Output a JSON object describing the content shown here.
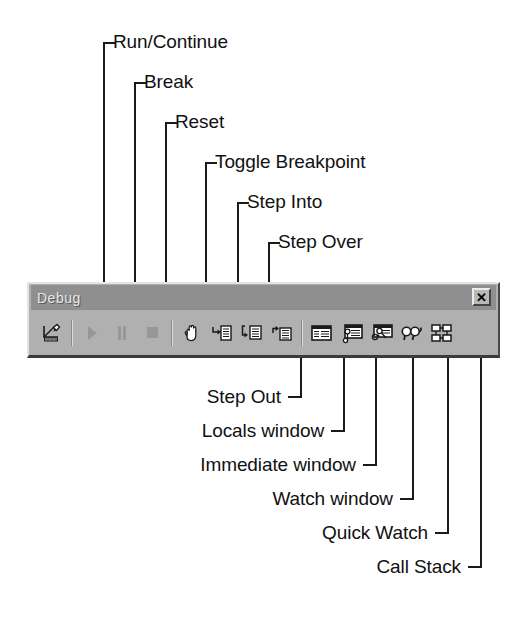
{
  "diagram": {
    "kind": "annotated-screenshot"
  },
  "toolbar": {
    "title": "Debug",
    "close_label": "✕",
    "close_icon": "close-icon",
    "buttons": [
      {
        "id": "design-mode",
        "icon": "pencil-ruler-icon",
        "tooltip": "Break",
        "enabled": true
      },
      {
        "id": "run-continue",
        "icon": "play-triangle-icon",
        "tooltip": "Run/Continue",
        "enabled": false
      },
      {
        "id": "break",
        "icon": "pause-bars-icon",
        "tooltip": "Break",
        "enabled": false
      },
      {
        "id": "reset",
        "icon": "stop-square-icon",
        "tooltip": "Reset",
        "enabled": false
      },
      {
        "id": "toggle-breakpoint",
        "icon": "hand-icon",
        "tooltip": "Toggle Breakpoint",
        "enabled": true
      },
      {
        "id": "step-into",
        "icon": "step-into-arrow-icon",
        "tooltip": "Step Into",
        "enabled": true
      },
      {
        "id": "step-over",
        "icon": "step-over-arrow-icon",
        "tooltip": "Step Over",
        "enabled": true
      },
      {
        "id": "step-out",
        "icon": "step-out-arrow-icon",
        "tooltip": "Step Out",
        "enabled": true
      },
      {
        "id": "locals-window",
        "icon": "locals-window-icon",
        "tooltip": "Locals Window",
        "enabled": true
      },
      {
        "id": "immediate-window",
        "icon": "immediate-window-icon",
        "tooltip": "Immediate Window",
        "enabled": true
      },
      {
        "id": "watch-window",
        "icon": "watch-window-icon",
        "tooltip": "Watch Window",
        "enabled": true
      },
      {
        "id": "quick-watch",
        "icon": "eyeglasses-icon",
        "tooltip": "Quick Watch",
        "enabled": true
      },
      {
        "id": "call-stack",
        "icon": "call-stack-boxes-icon",
        "tooltip": "Call Stack",
        "enabled": true
      }
    ]
  },
  "callouts": {
    "top": [
      {
        "label": "Run/Continue",
        "target": "run-continue"
      },
      {
        "label": "Break",
        "target": "break"
      },
      {
        "label": "Reset",
        "target": "reset"
      },
      {
        "label": "Toggle Breakpoint",
        "target": "toggle-breakpoint"
      },
      {
        "label": "Step Into",
        "target": "step-into"
      },
      {
        "label": "Step Over",
        "target": "step-over"
      }
    ],
    "bottom": [
      {
        "label": "Step Out",
        "target": "step-out"
      },
      {
        "label": "Locals window",
        "target": "locals-window"
      },
      {
        "label": "Immediate window",
        "target": "immediate-window"
      },
      {
        "label": "Watch window",
        "target": "watch-window"
      },
      {
        "label": "Quick Watch",
        "target": "quick-watch"
      },
      {
        "label": "Call Stack",
        "target": "call-stack"
      }
    ]
  },
  "colors": {
    "line": "#1a1a1a",
    "toolbar_face": "#b0b0b0",
    "titlebar": "#8f8f8f",
    "text": "#111111"
  }
}
